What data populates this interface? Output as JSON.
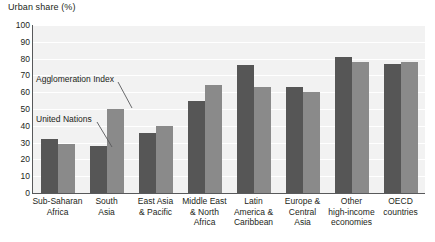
{
  "chart_data": {
    "type": "bar",
    "title": "Urban share (%)",
    "xlabel": "",
    "ylabel": "Urban share (%)",
    "ylim": [
      0,
      100
    ],
    "ytick_step": 10,
    "yticks": [
      "100",
      "90",
      "80",
      "70",
      "60",
      "50",
      "40",
      "30",
      "20",
      "10",
      "0"
    ],
    "grid": true,
    "legend_position": "in-plot annotations",
    "categories": [
      "Sub-Saharan Africa",
      "South Asia",
      "East Asia & Pacific",
      "Middle East & North Africa",
      "Latin America & Caribbean",
      "Europe & Central Asia",
      "Other high-income economies",
      "OECD countries"
    ],
    "category_lines": [
      [
        "Sub-Saharan",
        "Africa"
      ],
      [
        "South",
        "Asia"
      ],
      [
        "East Asia",
        "& Pacific"
      ],
      [
        "Middle East",
        "& North",
        "Africa"
      ],
      [
        "Latin",
        "America &",
        "Caribbean"
      ],
      [
        "Europe &",
        "Central",
        "Asia"
      ],
      [
        "Other",
        "high-income",
        "economies"
      ],
      [
        "OECD",
        "countries"
      ]
    ],
    "series": [
      {
        "name": "United Nations",
        "color": "#565656",
        "values": [
          32,
          28,
          36,
          55,
          76,
          63,
          81,
          77
        ]
      },
      {
        "name": "Agglomeration Index",
        "color": "#8a8a8a",
        "values": [
          29,
          50,
          40,
          64,
          63,
          60,
          78,
          78
        ]
      }
    ],
    "annotations": [
      {
        "text": "Agglomeration Index",
        "target_series": "Agglomeration Index",
        "target_category": "South Asia"
      },
      {
        "text": "United Nations",
        "target_series": "United Nations",
        "target_category": "South Asia"
      }
    ]
  },
  "style": {
    "plot_background": "#f2f2f2",
    "gridline_color": "#ffffff",
    "axis_color": "#58595b",
    "text_color": "#231f20"
  }
}
